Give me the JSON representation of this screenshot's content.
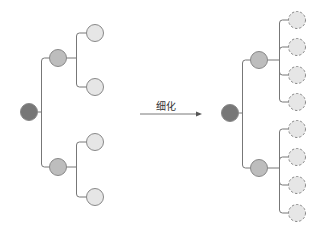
{
  "diagram": {
    "arrow_label": "细化",
    "colors": {
      "root": "#777777",
      "level1": "#bdbdbd",
      "leaf": "#e6e6e6",
      "stroke": "#888888",
      "line": "#777777"
    },
    "left_tree": {
      "root": {
        "x": 29,
        "y": 112
      },
      "level1": [
        {
          "x": 58,
          "y": 58
        },
        {
          "x": 58,
          "y": 167
        }
      ],
      "leaves": [
        {
          "x": 95,
          "y": 33
        },
        {
          "x": 95,
          "y": 87
        },
        {
          "x": 95,
          "y": 142
        },
        {
          "x": 95,
          "y": 197
        }
      ],
      "leaf_style": "solid"
    },
    "right_tree": {
      "root": {
        "x": 230,
        "y": 113
      },
      "level1": [
        {
          "x": 259,
          "y": 60
        },
        {
          "x": 259,
          "y": 168
        }
      ],
      "leaves": [
        {
          "x": 297,
          "y": 20
        },
        {
          "x": 297,
          "y": 47
        },
        {
          "x": 297,
          "y": 75
        },
        {
          "x": 297,
          "y": 102
        },
        {
          "x": 297,
          "y": 129
        },
        {
          "x": 297,
          "y": 157
        },
        {
          "x": 297,
          "y": 185
        },
        {
          "x": 297,
          "y": 213
        }
      ],
      "leaf_style": "dashed"
    }
  }
}
